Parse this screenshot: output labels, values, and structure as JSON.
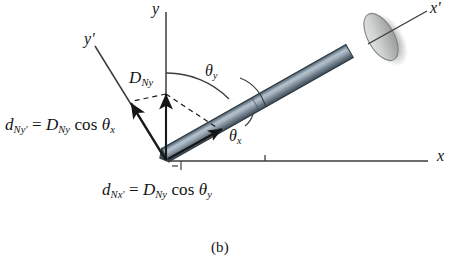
{
  "figure": {
    "caption": "(b)",
    "caption_name": "figure-caption-b",
    "background_color": "#ffffff"
  },
  "colors": {
    "nail_shaft_fill": "#6b7c8c",
    "nail_shaft_light": "#9aa9b5",
    "nail_shaft_dark": "#3e4d5a",
    "nail_head_fill": "#cfd3d2",
    "nail_head_shadow": "#a8aaa6",
    "axis_stroke": "#3c3c3c",
    "text": "#141414"
  },
  "axes": [
    {
      "name": "axis-y",
      "label_plain": "y",
      "label_base": "y",
      "prime": "",
      "x1": 166,
      "y1": 160,
      "x2": 166,
      "y2": 12
    },
    {
      "name": "axis-x",
      "label_plain": "x",
      "label_base": "x",
      "prime": "",
      "x1": 168,
      "y1": 161,
      "x2": 430,
      "y2": 161
    },
    {
      "name": "axis-x-prime",
      "label_plain": "x'",
      "label_base": "x",
      "prime": "'",
      "x1": 365,
      "y1": 45,
      "x2": 428,
      "y2": 10
    },
    {
      "name": "axis-y-prime",
      "label_plain": "y'",
      "label_base": "y",
      "prime": "'",
      "x1": 166,
      "y1": 160,
      "x2": 95,
      "y2": 45
    }
  ],
  "vectors": [
    {
      "name": "vector-d-ny",
      "label_base": "D",
      "label_sub": "Ny",
      "label_plain": "D_Ny",
      "description": "vertical component vector along y axis",
      "x1": 166,
      "y1": 160,
      "x2": 166,
      "y2": 92
    },
    {
      "name": "vector-d-ny-prime",
      "description": "projection of D_Ny onto the y' axis",
      "x1": 166,
      "y1": 160,
      "x2": 128,
      "y2": 98
    },
    {
      "name": "vector-d-nx-prime",
      "description": "projection of D_Ny onto the x' axis (along nail shaft)",
      "x1": 166,
      "y1": 160,
      "x2": 222,
      "y2": 129
    }
  ],
  "angles": [
    {
      "name": "angle-theta-y",
      "label_base": "θ",
      "label_sub": "y",
      "label_plain": "θy",
      "between": "y axis and nail axis (x')"
    },
    {
      "name": "angle-theta-x",
      "label_base": "θ",
      "label_sub": "x",
      "label_plain": "θx",
      "between": "x axis and nail axis (x')"
    }
  ],
  "equations": [
    {
      "name": "equation-d-ny-prime",
      "plain": "d_Ny' = D_Ny cos θ_x",
      "lhs_base": "d",
      "lhs_sub": "Ny'",
      "eq": " = ",
      "rhs_base": "D",
      "rhs_sub": "Ny",
      "fn": "cos",
      "angle_base": "θ",
      "angle_sub": "x"
    },
    {
      "name": "equation-d-nx-prime",
      "plain": "d_Nx' = D_Ny cos θ_y",
      "lhs_base": "d",
      "lhs_sub": "Nx'",
      "eq": " = ",
      "rhs_base": "D",
      "rhs_sub": "Ny",
      "fn": "cos",
      "angle_base": "θ",
      "angle_sub": "y"
    }
  ],
  "nail": {
    "name": "nail-object",
    "description": "nail drawn as an inclined shaft with an elliptical head at the upper right",
    "shaft_start_x": 170,
    "shaft_start_y": 160,
    "shaft_end_x": 368,
    "shaft_end_y": 48,
    "head_center_x": 382,
    "head_center_y": 38,
    "head_rx": 13,
    "head_ry": 26
  }
}
